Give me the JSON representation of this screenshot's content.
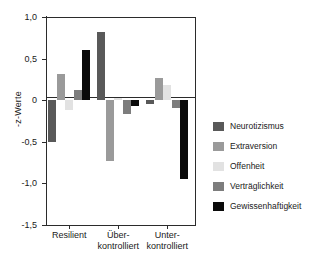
{
  "chart_data": {
    "type": "bar",
    "title": "",
    "xlabel": "",
    "ylabel": "-z-Werte",
    "ylim": [
      -1.5,
      1.0
    ],
    "yticks": [
      "1,0",
      "0,5",
      "0",
      "-0,5",
      "-1,0",
      "-1,5"
    ],
    "ytick_values": [
      1.0,
      0.5,
      0,
      -0.5,
      -1.0,
      -1.5
    ],
    "grid": false,
    "legend_position": "right",
    "categories": [
      "Resilient",
      "Über-\nkontrolliert",
      "Unter-\nkontrolliert"
    ],
    "category_labels": [
      {
        "line1": "Resilient",
        "line2": ""
      },
      {
        "line1": "Über-",
        "line2": "kontrolliert"
      },
      {
        "line1": "Unter-",
        "line2": "kontrolliert"
      }
    ],
    "series": [
      {
        "name": "Neurotizismus",
        "color": "#595959",
        "values": [
          -0.5,
          0.82,
          -0.05
        ]
      },
      {
        "name": "Extraversion",
        "color": "#9a9a9a",
        "values": [
          0.32,
          -0.73,
          0.27
        ]
      },
      {
        "name": "Offenheit",
        "color": "#e2e2e2",
        "values": [
          -0.12,
          0.03,
          0.18
        ]
      },
      {
        "name": "Verträglichkeit",
        "color": "#7d7d7d",
        "values": [
          0.12,
          -0.17,
          -0.09
        ]
      },
      {
        "name": "Gewissenhaftigkeit",
        "color": "#0a0a0a",
        "values": [
          0.6,
          -0.07,
          -0.95
        ]
      }
    ]
  },
  "legend": {
    "items": [
      {
        "label": "Neurotizismus",
        "color": "#595959"
      },
      {
        "label": "Extraversion",
        "color": "#9a9a9a"
      },
      {
        "label": "Offenheit",
        "color": "#e2e2e2"
      },
      {
        "label": "Verträglichkeit",
        "color": "#7d7d7d"
      },
      {
        "label": "Gewissenhaftigkeit",
        "color": "#0a0a0a"
      }
    ]
  },
  "axis": {
    "y_label": "-z-Werte",
    "y_ticks": [
      "1,0",
      "0,5",
      "0",
      "-0,5",
      "-1,0",
      "-1,5"
    ]
  }
}
